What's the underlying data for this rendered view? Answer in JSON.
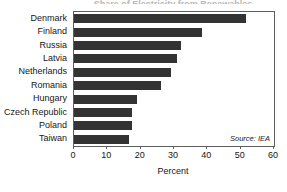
{
  "figure": {
    "title_remnant": "Share of Electricity from Renewables",
    "source_note": "Source: IEA"
  },
  "chart_data": {
    "type": "bar",
    "orientation": "horizontal",
    "title": "",
    "xlabel": "Percent",
    "ylabel": "",
    "xlim": [
      0,
      60
    ],
    "xticks": [
      0,
      10,
      20,
      30,
      40,
      50,
      60
    ],
    "xtick_labels": [
      "0",
      "10",
      "20",
      "30",
      "40",
      "50",
      "60"
    ],
    "grid": false,
    "legend": null,
    "bar_color": "#333333",
    "categories": [
      "Denmark",
      "Finland",
      "Russia",
      "Latvia",
      "Netherlands",
      "Romania",
      "Hungary",
      "Czech Republic",
      "Poland",
      "Taiwan"
    ],
    "values": [
      51.5,
      38.5,
      32,
      31,
      29,
      26,
      19,
      17.5,
      17.5,
      16.5
    ],
    "annotations": [
      "Source: IEA"
    ]
  }
}
